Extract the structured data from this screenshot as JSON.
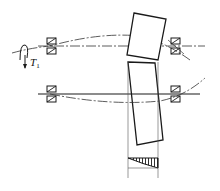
{
  "diagram": {
    "torque_label": "T",
    "torque_subscript": "1",
    "components": [
      {
        "name": "input-shaft",
        "kind": "shaft",
        "line": "centerline"
      },
      {
        "name": "output-shaft",
        "kind": "shaft",
        "line": "solid"
      },
      {
        "name": "pinion",
        "kind": "gear",
        "state": "tilted"
      },
      {
        "name": "gear",
        "kind": "gear",
        "state": "tilted"
      },
      {
        "name": "bearings",
        "kind": "bearing",
        "count": 4
      },
      {
        "name": "deflection-curves",
        "kind": "dash-dot curve",
        "count": 2
      },
      {
        "name": "load-distribution",
        "kind": "hatched triangular diagram"
      }
    ],
    "colors": {
      "line": "#1a1a1a",
      "background": "#ffffff"
    }
  }
}
